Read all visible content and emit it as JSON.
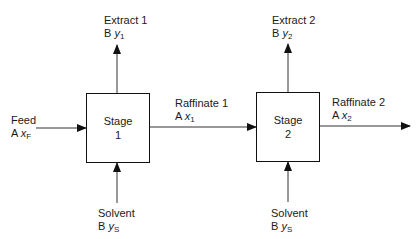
{
  "diagram": {
    "type": "two-stage crosscurrent extraction flow diagram",
    "stages": [
      {
        "title": "Stage",
        "number": "1"
      },
      {
        "title": "Stage",
        "number": "2"
      }
    ],
    "streams": {
      "feed": {
        "name": "Feed",
        "component": "A",
        "var": "x",
        "sub": "F"
      },
      "extract1": {
        "name": "Extract 1",
        "component": "B",
        "var": "y",
        "sub": "1"
      },
      "extract2": {
        "name": "Extract 2",
        "component": "B",
        "var": "y",
        "sub": "2"
      },
      "raffinate1": {
        "name": "Raffinate 1",
        "component": "A",
        "var": "x",
        "sub": "1"
      },
      "raffinate2": {
        "name": "Raffinate 2",
        "component": "A",
        "var": "x",
        "sub": "2"
      },
      "solvent1": {
        "name": "Solvent",
        "component": "B",
        "var": "y",
        "sub": "S"
      },
      "solvent2": {
        "name": "Solvent",
        "component": "B",
        "var": "y",
        "sub": "S"
      }
    }
  }
}
